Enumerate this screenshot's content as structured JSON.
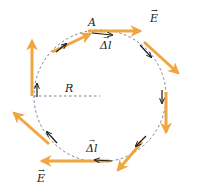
{
  "diagram": {
    "labels": {
      "point": "A",
      "field_top": "E",
      "field_bottom": "E",
      "dl_top": "Δl",
      "dl_bottom": "Δl",
      "radius": "R"
    },
    "colors": {
      "field_arrow": "#f0a640",
      "dl_arrow": "#1a1a1a",
      "circle": "#6a6f8a",
      "radius_line": "#6a6f8a"
    },
    "field_arrows": [
      {
        "angle_deg": 90,
        "direction": "clockwise-tangent"
      },
      {
        "angle_deg": 45,
        "direction": "clockwise-tangent"
      },
      {
        "angle_deg": 0,
        "direction": "clockwise-tangent"
      },
      {
        "angle_deg": -45,
        "direction": "clockwise-tangent"
      },
      {
        "angle_deg": -90,
        "direction": "clockwise-tangent"
      },
      {
        "angle_deg": -135,
        "direction": "clockwise-tangent"
      },
      {
        "angle_deg": 180,
        "direction": "clockwise-tangent"
      },
      {
        "angle_deg": 135,
        "direction": "clockwise-tangent"
      }
    ]
  }
}
